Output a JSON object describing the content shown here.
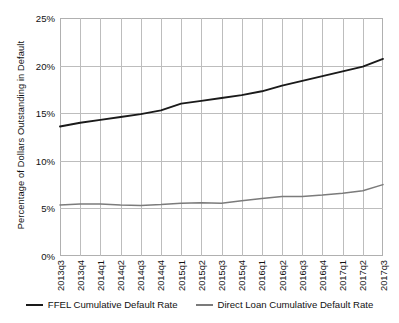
{
  "chart_data": {
    "type": "line",
    "title": "",
    "xlabel": "",
    "ylabel": "Percentage of Dollars Outstanding in Default",
    "ylim": [
      0,
      25
    ],
    "yticks": [
      0,
      5,
      10,
      15,
      20,
      25
    ],
    "ytick_labels": [
      "0%",
      "5%",
      "10%",
      "15%",
      "20%",
      "25%"
    ],
    "grid": true,
    "legend_position": "bottom",
    "categories": [
      "2013q3",
      "2013q4",
      "2014q1",
      "2014q2",
      "2014q3",
      "2014q4",
      "2015q1",
      "2015q2",
      "2015q3",
      "2015q4",
      "2016q1",
      "2016q2",
      "2016q3",
      "2016q4",
      "2017q1",
      "2017q2",
      "2017q3"
    ],
    "series": [
      {
        "name": "FFEL Cumulative Default Rate",
        "color": "#1a1a1a",
        "values": [
          13.6,
          14.0,
          14.3,
          14.6,
          14.9,
          15.3,
          16.0,
          16.3,
          16.6,
          16.9,
          17.3,
          17.9,
          18.4,
          18.9,
          19.4,
          19.9,
          20.7
        ]
      },
      {
        "name": "Direct Loan Cumulative Default Rate",
        "color": "#7b7b7b",
        "values": [
          5.35,
          5.45,
          5.45,
          5.35,
          5.3,
          5.4,
          5.55,
          5.6,
          5.55,
          5.8,
          6.05,
          6.25,
          6.25,
          6.4,
          6.6,
          6.85,
          7.5
        ]
      }
    ]
  },
  "legend": {
    "items": [
      {
        "label": "FFEL Cumulative Default Rate",
        "color": "#1a1a1a"
      },
      {
        "label": "Direct Loan Cumulative Default Rate",
        "color": "#7b7b7b"
      }
    ]
  },
  "cropped_header": ""
}
